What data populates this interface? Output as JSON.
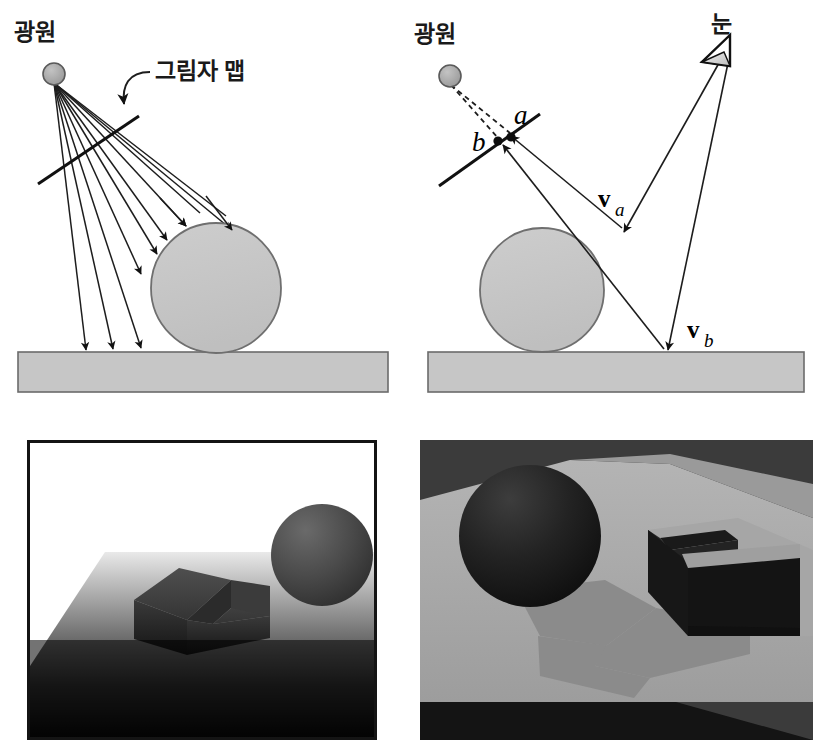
{
  "figure": {
    "background_color": "#ffffff"
  },
  "colors": {
    "ink": "#1a1a1a",
    "line": "#222222",
    "sphere_fill": "#c6c6c6",
    "sphere_stroke": "#6f6f6f",
    "ground_fill": "#c6c6c6",
    "ground_stroke": "#6b6b6b",
    "light_fill": "#a8a8a8",
    "light_stroke": "#5a5a5a",
    "panel_border": "#141414",
    "render_left_bg": "#ffffff",
    "render_right_bg": "#3b3b3b",
    "render_plane": "#a9a9a9",
    "render_shadow": "#8a8a8a",
    "render_dark": "#181818"
  },
  "panels": {
    "top_left": {
      "name": "shadow-map-generation-diagram",
      "labels": {
        "light_source": "광원",
        "shadow_map": "그림자 맵"
      },
      "elements": {
        "light_source_icon": "light-source-dot",
        "ray_count": 10,
        "ground_arrows": 3,
        "sphere_arrows": 4,
        "shadow_map_plane": "shadow-map-line",
        "callout_arrow": "curved-callout-arrow"
      }
    },
    "top_right": {
      "name": "shadow-map-lookup-diagram",
      "labels": {
        "light_source": "광원",
        "eye": "눈",
        "point_a": "a",
        "point_b": "b",
        "vector_a": "v",
        "vector_a_sub": "a",
        "vector_b": "v",
        "vector_b_sub": "b"
      },
      "elements": {
        "eye_icon": "eye-triangle",
        "light_source_icon": "light-source-dot",
        "dashed_rays": 2,
        "view_rays": 2,
        "shadow_map_plane": "shadow-map-line"
      }
    },
    "bottom_left": {
      "name": "depth-map-render",
      "caption": "",
      "description": "Depth map render: dark gradient ground plane with notched box and sphere"
    },
    "bottom_right": {
      "name": "shadowed-scene-render",
      "caption": "",
      "description": "Final shaded render: dark sphere and open box casting shadows on a gray plane"
    }
  }
}
